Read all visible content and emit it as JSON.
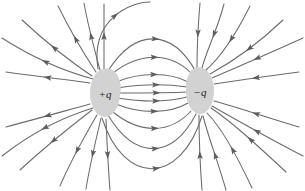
{
  "figure": {
    "type": "field-line-diagram",
    "background_color": "#ffffff",
    "line_color": "#6b6b6b",
    "arrow_color": "#5d5d5d",
    "charge_fill_color": "#d2d2d2",
    "label_color": "#1a1a1a",
    "width": 305,
    "height": 191
  },
  "charges": [
    {
      "id": "positive",
      "label": "+q",
      "sign": "+",
      "cx": 105,
      "cy": 93,
      "rx": 15,
      "ry": 24,
      "label_x": 105,
      "label_y": 95
    },
    {
      "id": "negative",
      "label": "−q",
      "sign": "−",
      "cx": 200,
      "cy": 91,
      "rx": 14,
      "ry": 23,
      "label_x": 200,
      "label_y": 93
    }
  ],
  "chart_data": {
    "type": "line",
    "xlabel": "",
    "ylabel": "",
    "legend": [],
    "annotations": [
      "+q",
      "−q"
    ],
    "series": [
      {
        "name": "central-line-0",
        "path": "M 118 93 C 140 93 170 93 187 92",
        "arrows": [
          {
            "t": 0.55,
            "dir": "right"
          }
        ]
      },
      {
        "name": "central-line-up-1",
        "path": "M 116 82 C 140 72 170 72 188 82",
        "arrows": [
          {
            "t": 0.52,
            "dir": "right"
          }
        ]
      },
      {
        "name": "central-line-up-2",
        "path": "M 113 73 C 140 52 170 52 191 73",
        "arrows": [
          {
            "t": 0.52,
            "dir": "right"
          }
        ]
      },
      {
        "name": "central-line-up-3",
        "path": "M 108 71 C 135 28 172 28 196 72",
        "arrows": [
          {
            "t": 0.52,
            "dir": "right"
          }
        ]
      },
      {
        "name": "central-line-down-1",
        "path": "M 116 104 C 140 114 170 114 188 103",
        "arrows": [
          {
            "t": 0.52,
            "dir": "right"
          }
        ]
      },
      {
        "name": "central-line-down-2",
        "path": "M 113 112 C 140 134 170 134 191 111",
        "arrows": [
          {
            "t": 0.52,
            "dir": "right"
          }
        ]
      },
      {
        "name": "central-line-down-3",
        "path": "M 108 115 C 135 160 172 160 196 114",
        "arrows": [
          {
            "t": 0.52,
            "dir": "right"
          }
        ]
      },
      {
        "name": "central-line-down-4",
        "path": "M 102 118 C 124 186 180 186 202 116",
        "arrows": [
          {
            "t": 0.52,
            "dir": "right"
          }
        ]
      },
      {
        "name": "central-line-up-4",
        "path": "M 117 88 C 142 84 168 84 187 87",
        "arrows": [
          {
            "t": 0.55,
            "dir": "right"
          }
        ]
      },
      {
        "name": "central-line-down-5",
        "path": "M 117 98 C 142 102 168 102 187 97",
        "arrows": [
          {
            "t": 0.55,
            "dir": "right"
          }
        ]
      },
      {
        "name": "left-out-horizontal-upper",
        "path": "M 90 83 C 70 80 40 77 6 72",
        "arrows": [
          {
            "t": 0.5,
            "dir": "left"
          }
        ]
      },
      {
        "name": "left-out-horizontal-lower",
        "path": "M 90 104 C 68 110 40 118 6 127",
        "arrows": [
          {
            "t": 0.5,
            "dir": "left"
          }
        ]
      },
      {
        "name": "left-out-up-1",
        "path": "M 92 76 C 74 64 48 44 22 20",
        "arrows": [
          {
            "t": 0.52,
            "dir": "left"
          }
        ]
      },
      {
        "name": "left-out-up-2",
        "path": "M 96 72 C 84 54 70 30 58 6",
        "arrows": [
          {
            "t": 0.5,
            "dir": "left"
          }
        ]
      },
      {
        "name": "left-out-up-3",
        "path": "M 100 70 C 94 48 88 26 84 3",
        "arrows": [
          {
            "t": 0.5,
            "dir": "left"
          }
        ]
      },
      {
        "name": "left-out-up-4",
        "path": "M 104 69 C 104 46 104 24 104 4",
        "arrows": [
          {
            "t": 0.5,
            "dir": "up"
          }
        ]
      },
      {
        "name": "left-out-down-1",
        "path": "M 92 110 C 74 124 48 144 20 170",
        "arrows": [
          {
            "t": 0.52,
            "dir": "left"
          }
        ]
      },
      {
        "name": "left-out-down-2",
        "path": "M 97 115 C 86 134 72 158 60 186",
        "arrows": [
          {
            "t": 0.5,
            "dir": "left"
          }
        ]
      },
      {
        "name": "left-out-down-3",
        "path": "M 101 118 C 96 140 90 164 86 189",
        "arrows": [
          {
            "t": 0.5,
            "dir": "left"
          }
        ]
      },
      {
        "name": "left-out-down-4",
        "path": "M 106 119 C 107 142 108 166 110 190",
        "arrows": [
          {
            "t": 0.5,
            "dir": "down"
          }
        ]
      },
      {
        "name": "outer-loop-up-left-1",
        "path": "M 98 69 C 90 18 132 2 150 2",
        "arrows": [
          {
            "t": 0.6,
            "dir": "right"
          }
        ]
      },
      {
        "name": "right-in-horizontal-upper",
        "path": "M 299 72 C 268 76 240 80 214 84",
        "arrows": [
          {
            "t": 0.5,
            "dir": "left"
          }
        ]
      },
      {
        "name": "right-in-horizontal-lower",
        "path": "M 299 127 C 268 118 240 108 214 101",
        "arrows": [
          {
            "t": 0.5,
            "dir": "left"
          }
        ]
      },
      {
        "name": "right-in-up-1",
        "path": "M 283 20 C 258 44 232 62 210 74",
        "arrows": [
          {
            "t": 0.48,
            "dir": "down-left"
          }
        ]
      },
      {
        "name": "right-in-up-2",
        "path": "M 250 6 C 238 30 222 56 206 70",
        "arrows": [
          {
            "t": 0.48,
            "dir": "down-left"
          }
        ]
      },
      {
        "name": "right-in-up-3",
        "path": "M 224 4 C 218 28 206 52 202 68",
        "arrows": [
          {
            "t": 0.46,
            "dir": "down"
          }
        ]
      },
      {
        "name": "right-in-up-4",
        "path": "M 200 3 C 198 26 197 50 197 68",
        "arrows": [
          {
            "t": 0.46,
            "dir": "down"
          }
        ]
      },
      {
        "name": "right-in-down-1",
        "path": "M 286 172 C 258 146 232 122 211 108",
        "arrows": [
          {
            "t": 0.48,
            "dir": "up-left"
          }
        ]
      },
      {
        "name": "right-in-down-2",
        "path": "M 252 188 C 238 158 222 128 207 113",
        "arrows": [
          {
            "t": 0.48,
            "dir": "up-left"
          }
        ]
      },
      {
        "name": "right-in-down-3",
        "path": "M 226 190 C 218 162 208 136 203 116",
        "arrows": [
          {
            "t": 0.46,
            "dir": "up"
          }
        ]
      },
      {
        "name": "right-in-down-4",
        "path": "M 202 190 C 200 164 199 136 199 115",
        "arrows": [
          {
            "t": 0.46,
            "dir": "up"
          }
        ]
      },
      {
        "name": "far-left-upper-edge",
        "path": "M 93 79 C 60 70 30 56 2 38",
        "arrows": [
          {
            "t": 0.5,
            "dir": "left"
          }
        ]
      },
      {
        "name": "far-left-lower-edge",
        "path": "M 93 108 C 60 118 30 134 2 156",
        "arrows": [
          {
            "t": 0.5,
            "dir": "left"
          }
        ]
      },
      {
        "name": "far-right-upper-edge",
        "path": "M 303 38 C 272 52 240 66 212 78",
        "arrows": [
          {
            "t": 0.5,
            "dir": "down-left"
          }
        ]
      },
      {
        "name": "far-right-lower-edge",
        "path": "M 303 156 C 272 140 240 122 212 106",
        "arrows": [
          {
            "t": 0.5,
            "dir": "up-left"
          }
        ]
      }
    ]
  }
}
